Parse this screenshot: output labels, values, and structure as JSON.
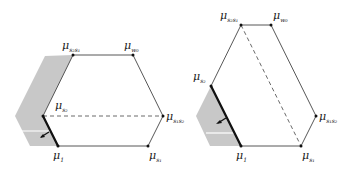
{
  "diagrams": [
    {
      "id": "left",
      "labels": {
        "top_left": {
          "base": "μ",
          "sub": "s₂s₁"
        },
        "top_right": {
          "base": "μ",
          "sub": "w₀"
        },
        "right": {
          "base": "μ",
          "sub": "s₁s₂"
        },
        "bottom_right": {
          "base": "μ",
          "sub": "s₁"
        },
        "bottom_left": {
          "base": "μ",
          "sub": "1"
        },
        "left": {
          "base": "μ",
          "sub": "s₂"
        }
      }
    },
    {
      "id": "right",
      "labels": {
        "top_left": {
          "base": "μ",
          "sub": "s₂s₁"
        },
        "top_right": {
          "base": "μ",
          "sub": "w₀"
        },
        "right": {
          "base": "μ",
          "sub": "s₁s₂"
        },
        "bottom_right": {
          "base": "μ",
          "sub": "s₁"
        },
        "bottom_left": {
          "base": "μ",
          "sub": "1"
        },
        "left": {
          "base": "μ",
          "sub": "s₂"
        }
      }
    }
  ],
  "colors": {
    "line": "#333333",
    "shade": "#c8c8c8",
    "bold_edge": "#111111"
  }
}
